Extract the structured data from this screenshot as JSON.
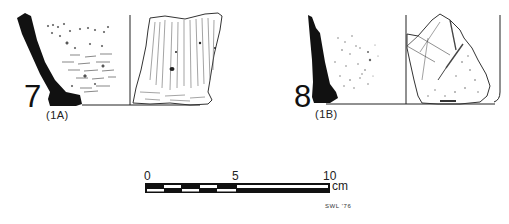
{
  "figures": [
    {
      "number": "7",
      "catalog": "(1A)"
    },
    {
      "number": "8",
      "catalog": "(1B)"
    }
  ],
  "scale_bar": {
    "ticks": [
      "0",
      "5",
      "10"
    ],
    "unit": "cm"
  },
  "signature": "SWL '76",
  "colors": {
    "ink": "#111111",
    "paper": "#ffffff"
  }
}
